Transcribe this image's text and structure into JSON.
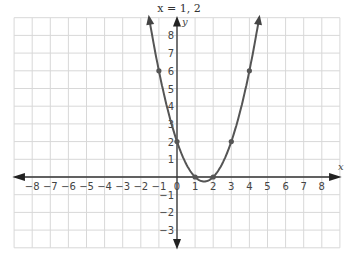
{
  "title_text": "x = 1, 2",
  "chart_data": {
    "type": "line",
    "title": "x = 1, 2",
    "xlabel": "x",
    "ylabel": "y",
    "function": "y = x^2 - 3x + 2",
    "xlim": [
      -9,
      9
    ],
    "ylim": [
      -4,
      9
    ],
    "x_ticks": [
      -8,
      -7,
      -6,
      -5,
      -4,
      -3,
      -2,
      -1,
      0,
      1,
      2,
      3,
      4,
      5,
      6,
      7,
      8
    ],
    "y_ticks": [
      -3,
      -2,
      -1,
      1,
      2,
      3,
      4,
      5,
      6,
      7,
      8
    ],
    "grid": true,
    "points": [
      {
        "x": -1,
        "y": 6
      },
      {
        "x": 0,
        "y": 2
      },
      {
        "x": 1,
        "y": 0
      },
      {
        "x": 2,
        "y": 0
      },
      {
        "x": 3,
        "y": 2
      },
      {
        "x": 4,
        "y": 6
      }
    ],
    "roots": [
      1,
      2
    ],
    "curve_color": "#555555"
  }
}
